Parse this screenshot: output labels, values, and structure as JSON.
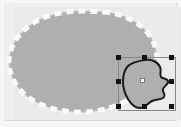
{
  "app": {
    "view_name": "drawing-canvas",
    "canvas_width": 181,
    "canvas_height": 127,
    "background_color": "#f0f0f0",
    "paper_color": "#fcfcfc"
  },
  "shapes": [
    {
      "id": "large-blob",
      "name": "large-blob-shape",
      "label": "Large blob",
      "fill_color": "#b3b3b3",
      "stroke_color": "#ffffff",
      "stroke_style": "dashed",
      "stroke_width": 5,
      "dash_pattern": "7 5",
      "selected": false,
      "path": "M 103 12 C 120 13 136 20 146 31 C 156 42 159 56 155 69 C 151 82 141 93 126 101 C 111 109 93 113 75 112 C 57 111 40 106 28 97 C 16 88 9 75 9 62 C 9 48 17 35 29 26 C 41 17 58 12 76 11 C 85 11 94 11 103 12 Z"
    },
    {
      "id": "selected-shape",
      "name": "irregular-selected-shape",
      "label": "Irregular shape",
      "fill_color": "#b3b3b3",
      "stroke_color": "#1a1a1a",
      "stroke_style": "solid",
      "stroke_width": 2,
      "selected": true,
      "path": "M 145 60 C 152 59 158 62 160 67 C 162 71 159 74 161 77 C 163 79 167 78 168 81 C 169 84 164 86 163 89 C 162 92 166 94 164 97 C 162 100 156 99 152 101 C 148 103 145 108 140 108 C 135 108 131 104 128 99 C 125 94 123 88 123 82 C 123 76 124 70 128 66 C 132 62 139 61 145 60 Z"
    }
  ],
  "selection": {
    "name": "selection-bounding-box",
    "visible": true,
    "box": {
      "x": 118,
      "y": 57,
      "width": 58,
      "height": 54
    },
    "handle_color": "#141414",
    "handle_size": 5,
    "outline_color": "#8a8a8a",
    "handles": [
      {
        "name": "handle-top-left",
        "x": 118,
        "y": 57
      },
      {
        "name": "handle-top-center",
        "x": 144,
        "y": 57
      },
      {
        "name": "handle-top-right",
        "x": 171,
        "y": 57
      },
      {
        "name": "handle-middle-left",
        "x": 118,
        "y": 81
      },
      {
        "name": "handle-middle-right",
        "x": 171,
        "y": 81
      },
      {
        "name": "handle-bottom-left",
        "x": 118,
        "y": 106
      },
      {
        "name": "handle-bottom-center",
        "x": 144,
        "y": 106
      },
      {
        "name": "handle-bottom-right",
        "x": 171,
        "y": 106
      }
    ],
    "anchor": {
      "name": "center-anchor-point",
      "x": 142,
      "y": 80,
      "color": "#ffffff",
      "border_color": "#7a7a7a"
    }
  }
}
